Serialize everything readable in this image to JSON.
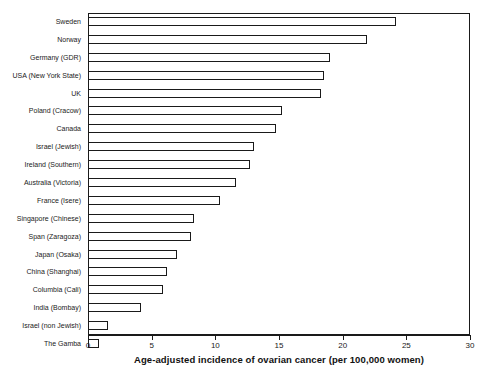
{
  "corner_fragment": "",
  "chart_data": {
    "type": "bar",
    "orientation": "horizontal",
    "title": "",
    "xlabel": "Age-adjusted incidence of ovarian cancer (per 100,000 women)",
    "ylabel": "",
    "xlim": [
      0,
      30
    ],
    "xticks": [
      0,
      5,
      10,
      15,
      20,
      25,
      30
    ],
    "xticklabels": [
      "0",
      "5",
      "10",
      "15",
      "20",
      "25",
      "30"
    ],
    "grid": false,
    "legend": false,
    "bar_facecolor": "#ffffff",
    "bar_edgecolor": "#1a1a1a",
    "categories": [
      "Sweden",
      "Norway",
      "Germany (GDR)",
      "USA (New York State)",
      "UK",
      "Poland (Cracow)",
      "Canada",
      "Israel (Jewish)",
      "Ireland (Southern)",
      "Australia (Victoria)",
      "France (Isere)",
      "Singapore (Chinese)",
      "Span (Zaragoza)",
      "Japan (Osaka)",
      "China (Shanghai)",
      "Columbia (Cali)",
      "India (Bombay)",
      "Israel (non Jewish)",
      "The Gamba"
    ],
    "values": [
      24.2,
      21.9,
      19.0,
      18.5,
      18.3,
      15.2,
      14.8,
      13.0,
      12.7,
      11.6,
      10.4,
      8.3,
      8.1,
      7.0,
      6.2,
      5.9,
      4.2,
      1.6,
      0.9
    ]
  }
}
